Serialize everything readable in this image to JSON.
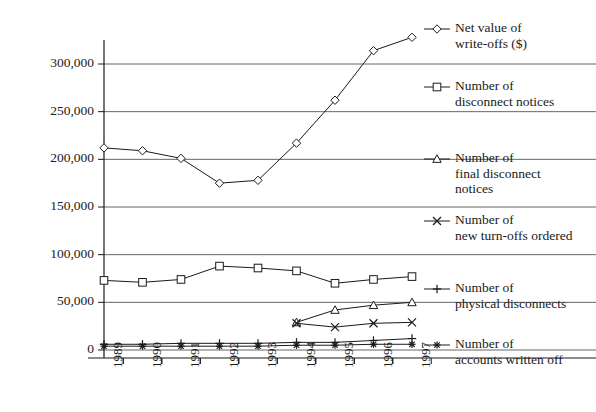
{
  "chart_data": {
    "type": "line",
    "title": "",
    "xlabel": "",
    "ylabel": "",
    "categories": [
      "1989",
      "1990",
      "1991",
      "1992",
      "1993",
      "1994",
      "1995",
      "1996",
      "1997"
    ],
    "ylim": [
      0,
      325000
    ],
    "yticks": [
      0,
      50000,
      100000,
      150000,
      200000,
      250000,
      300000
    ],
    "ytick_labels": [
      "0",
      "50,000",
      "100,000",
      "150,000",
      "200,000",
      "250,000",
      "300,000"
    ],
    "grid": true,
    "legend_position": "right",
    "series": [
      {
        "name": "Net value of write-offs ($)",
        "label_lines": [
          "Net value of",
          "write-offs ($)"
        ],
        "marker": "diamond",
        "values": [
          212000,
          209000,
          201000,
          175000,
          178000,
          217000,
          262000,
          314000,
          328000
        ]
      },
      {
        "name": "Number of disconnect notices",
        "label_lines": [
          "Number of",
          "disconnect notices"
        ],
        "marker": "square",
        "values": [
          73000,
          71000,
          74000,
          88000,
          86000,
          83000,
          70000,
          74000,
          77000
        ]
      },
      {
        "name": "Number of final disconnect notices",
        "label_lines": [
          "Number of",
          "final disconnect",
          "notices"
        ],
        "marker": "triangle",
        "values": [
          null,
          null,
          null,
          null,
          null,
          29000,
          42000,
          47000,
          50000
        ]
      },
      {
        "name": "Number of new turn-offs ordered",
        "label_lines": [
          "Number of",
          "new turn-offs ordered"
        ],
        "marker": "cross",
        "values": [
          null,
          null,
          null,
          null,
          null,
          28000,
          24000,
          28000,
          29000
        ]
      },
      {
        "name": "Number of physical disconnects",
        "label_lines": [
          "Number of",
          "physical disconnects"
        ],
        "marker": "plus",
        "values": [
          6000,
          6000,
          7000,
          7000,
          7000,
          8000,
          8000,
          10000,
          12000
        ]
      },
      {
        "name": "Number of accounts written off",
        "label_lines": [
          "Number of",
          "accounts written off"
        ],
        "marker": "star",
        "values": [
          4000,
          4000,
          4000,
          4000,
          4000,
          5000,
          5000,
          6000,
          6000
        ]
      }
    ],
    "colors": {
      "line": "#1a1a1a",
      "grid": "#666666",
      "axis": "#1a1a1a",
      "background": "#ffffff"
    }
  }
}
